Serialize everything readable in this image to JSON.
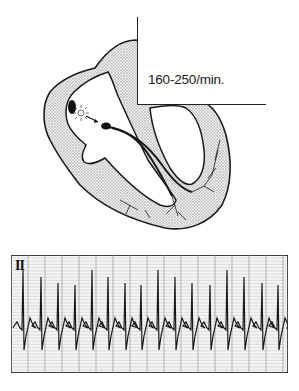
{
  "figure": {
    "rate_label": "160-250/min.",
    "ecg": {
      "lead_label": "II",
      "complex_count": 16,
      "grid_color": "#b8b8b8",
      "trace_color": "#1a1a1a",
      "r_peak_x": [
        23,
        41,
        58,
        75,
        92,
        108,
        125,
        141,
        158,
        175,
        192,
        210,
        227,
        244,
        262,
        278
      ]
    },
    "colors": {
      "outline": "#1a1a1a",
      "myocardium_fill": "#d9d9d9",
      "background": "#ffffff"
    }
  }
}
